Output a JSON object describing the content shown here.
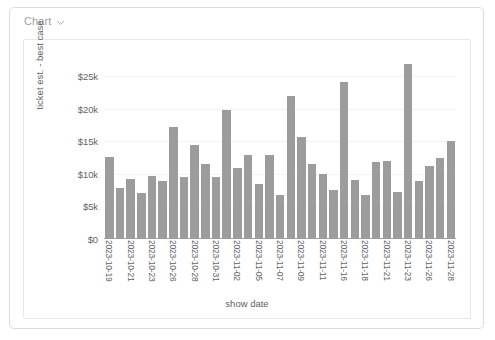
{
  "card": {
    "header": {
      "menu_label": "Chart",
      "menu_icon": "chevron-down-icon"
    }
  },
  "colors": {
    "bar": "#9c9c9c",
    "axis": "#9e9e9e",
    "grid": "#f2f2f2",
    "card_border": "#dcdcdc",
    "panel_border": "#e8e8e8",
    "text": "#5f6368",
    "muted_text": "#9aa0a6"
  },
  "chart_data": {
    "type": "bar",
    "title": "",
    "xlabel": "show date",
    "ylabel": "ticket est. - best case",
    "ylim": [
      0,
      27500
    ],
    "ytick_labels": [
      "$0",
      "$5k",
      "$10k",
      "$15k",
      "$20k",
      "$25k"
    ],
    "ytick_values": [
      0,
      5000,
      10000,
      15000,
      20000,
      25000
    ],
    "grid": true,
    "legend": false,
    "x_label_rotation": 90,
    "x_label_interval": 2,
    "categories": [
      "2023-10-19",
      "2023-10-20",
      "2023-10-21",
      "2023-10-22",
      "2023-10-23",
      "2023-10-25",
      "2023-10-26",
      "2023-10-27",
      "2023-10-28",
      "2023-10-29",
      "2023-10-31",
      "2023-11-01",
      "2023-11-02",
      "2023-11-03",
      "2023-11-05",
      "2023-11-06",
      "2023-11-07",
      "2023-11-08",
      "2023-11-09",
      "2023-11-10",
      "2023-11-11",
      "2023-11-12",
      "2023-11-16",
      "2023-11-17",
      "2023-11-18",
      "2023-11-19",
      "2023-11-21",
      "2023-11-22",
      "2023-11-23",
      "2023-11-24",
      "2023-11-26",
      "2023-11-27",
      "2023-11-28"
    ],
    "tick_labels": [
      "2023-10-19",
      "",
      "2023-10-21",
      "",
      "2023-10-23",
      "",
      "2023-10-26",
      "",
      "2023-10-28",
      "",
      "2023-10-31",
      "",
      "2023-11-02",
      "",
      "2023-11-05",
      "",
      "2023-11-07",
      "",
      "2023-11-09",
      "",
      "2023-11-11",
      "",
      "2023-11-16",
      "",
      "2023-11-18",
      "",
      "2023-11-21",
      "",
      "2023-11-23",
      "",
      "2023-11-26",
      "",
      "2023-11-28"
    ],
    "values": [
      12400,
      7700,
      9000,
      6900,
      9600,
      8800,
      17000,
      9300,
      14300,
      11300,
      9400,
      19600,
      10800,
      12800,
      8300,
      12700,
      6600,
      21800,
      15500,
      11300,
      9900,
      7300,
      23900,
      8900,
      6600,
      11700,
      11800,
      7100,
      26700,
      8700,
      11100,
      12300,
      14900
    ],
    "units": "USD"
  }
}
